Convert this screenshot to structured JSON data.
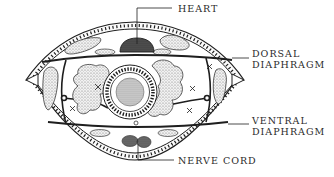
{
  "diagram": {
    "ink_color": "#1e1e1e",
    "stipple_color": "#555555",
    "background": "#ffffff"
  },
  "labels": {
    "heart": "HEART",
    "dorsal_diaphragm": {
      "line1": "DORSAL",
      "line2": "DIAPHRAGM"
    },
    "ventral_diaphragm": {
      "line1": "VENTRAL",
      "line2": "DIAPHRAGM"
    },
    "nerve_cord": "NERVE CORD"
  }
}
